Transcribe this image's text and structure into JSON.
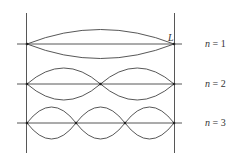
{
  "diagram": {
    "end_label": "L",
    "modes": [
      {
        "n": 1,
        "label_var": "n",
        "label_eq": " = 1",
        "loops": 1
      },
      {
        "n": 2,
        "label_var": "n",
        "label_eq": " = 2",
        "loops": 2
      },
      {
        "n": 3,
        "label_var": "n",
        "label_eq": " = 3",
        "loops": 3
      }
    ],
    "colors": {
      "line": "#444444",
      "background": "#ffffff"
    }
  }
}
